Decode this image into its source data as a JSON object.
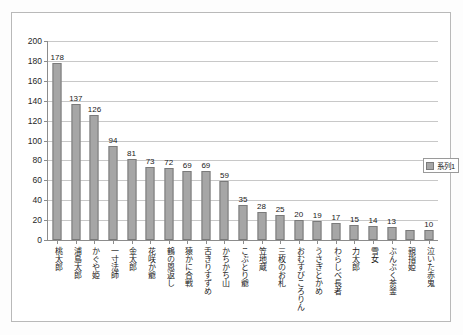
{
  "chart_data": {
    "type": "bar",
    "title": "",
    "subtitle": "",
    "xlabel": "",
    "ylabel": "",
    "ylim": [
      0,
      200
    ],
    "ytick_step": 20,
    "yticks": [
      "0",
      "20",
      "40",
      "60",
      "80",
      "100",
      "120",
      "140",
      "160",
      "180",
      "200"
    ],
    "grid": true,
    "legend_position": "inside-right",
    "legend": [
      "系列1"
    ],
    "categories": [
      "桃太郎",
      "浦島太郎",
      "かぐや姫",
      "一寸法師",
      "金太郎",
      "花咲か爺",
      "鶴の恩返し",
      "猿かに合戦",
      "舌きりすずめ",
      "かちかち山",
      "こぶとり爺",
      "笠地蔵",
      "三枚のお札",
      "おむすびころりん",
      "うさぎとかめ",
      "わらしべ長者",
      "力太郎",
      "雪女",
      "ぶんぶく茶釜",
      "親指姫",
      "泣いた赤鬼"
    ],
    "values": [
      178,
      137,
      126,
      94,
      81,
      73,
      72,
      69,
      69,
      59,
      35,
      28,
      25,
      20,
      19,
      17,
      15,
      14,
      13,
      10,
      10
    ],
    "data_labels": [
      "178",
      "137",
      "126",
      "94",
      "81",
      "73",
      "72",
      "69",
      "69",
      "59",
      "35",
      "28",
      "25",
      "20",
      "19",
      "17",
      "15",
      "14",
      "13",
      "",
      "10"
    ],
    "series": [
      {
        "name": "系列1",
        "values": [
          178,
          137,
          126,
          94,
          81,
          73,
          72,
          69,
          69,
          59,
          35,
          28,
          25,
          20,
          19,
          17,
          15,
          14,
          13,
          10,
          10
        ]
      }
    ],
    "annotations": [
      {
        "name": "edge-overflow-value",
        "text": "10"
      }
    ],
    "colors": {
      "bar_fill": "#a6a6a6",
      "bar_stroke": "#7a7a7a",
      "grid": "#c8c8c8",
      "axis": "#8c8c8c",
      "text": "#1a1a1a",
      "plot_background": "#ffffff",
      "page_background": "#fdfdfd",
      "frame_border": "#b9b9b9"
    }
  }
}
